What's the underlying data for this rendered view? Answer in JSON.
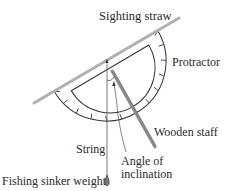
{
  "diagram": {
    "type": "clinometer-illustration",
    "labels": {
      "sighting_straw": "Sighting straw",
      "protractor": "Protractor",
      "wooden_staff": "Wooden staff",
      "string": "String",
      "angle_line1": "Angle of",
      "angle_line2": "inclination",
      "sinker": "Fishing sinker weight"
    },
    "colors": {
      "straw": "#b0b0b0",
      "outline": "#333333",
      "staff": "#8a8a8a",
      "text": "#2a2a2a"
    }
  }
}
